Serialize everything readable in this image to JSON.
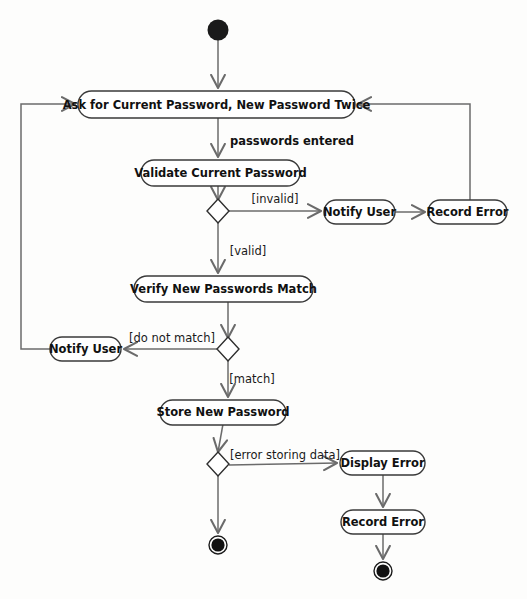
{
  "diagram": {
    "type": "uml-activity-diagram",
    "background_color": "#fdfdfc",
    "line_color": "#6b6b6b",
    "shape_stroke_color": "#3a3a3a",
    "text_color": "#111111",
    "nodes": [
      {
        "id": "start",
        "kind": "initial-node",
        "label": "",
        "x": 218,
        "y": 30,
        "r": 10
      },
      {
        "id": "ask",
        "kind": "action",
        "label": "Ask for Current Password, New Password Twice",
        "x": 78,
        "y": 91,
        "w": 277,
        "h": 26
      },
      {
        "id": "validate",
        "kind": "action",
        "label": "Validate Current Password",
        "x": 141,
        "y": 160,
        "w": 159,
        "h": 26
      },
      {
        "id": "dec1",
        "kind": "decision",
        "label": "",
        "cx": 218,
        "cy": 210,
        "rx": 11,
        "ry": 11
      },
      {
        "id": "notify1",
        "kind": "action",
        "label": "Notify User",
        "x": 324,
        "y": 200,
        "w": 71,
        "h": 24
      },
      {
        "id": "record1",
        "kind": "action",
        "label": "Record Error",
        "x": 428,
        "y": 200,
        "w": 79,
        "h": 24
      },
      {
        "id": "verify",
        "kind": "action",
        "label": "Verify New Passwords Match",
        "x": 134,
        "y": 276,
        "w": 179,
        "h": 26
      },
      {
        "id": "dec2",
        "kind": "decision",
        "label": "",
        "cx": 228,
        "cy": 348,
        "rx": 11,
        "ry": 11
      },
      {
        "id": "notify2",
        "kind": "action",
        "label": "Notify User",
        "x": 50,
        "y": 337,
        "w": 71,
        "h": 24
      },
      {
        "id": "store",
        "kind": "action",
        "label": "Store New Password",
        "x": 160,
        "y": 400,
        "w": 126,
        "h": 24
      },
      {
        "id": "dec3",
        "kind": "decision",
        "label": "",
        "cx": 218,
        "cy": 462,
        "rx": 11,
        "ry": 11
      },
      {
        "id": "display",
        "kind": "action",
        "label": "Display Error",
        "x": 340,
        "y": 451,
        "w": 85,
        "h": 24
      },
      {
        "id": "record2",
        "kind": "action",
        "label": "Record Error",
        "x": 341,
        "y": 510,
        "w": 84,
        "h": 24
      },
      {
        "id": "final1",
        "kind": "final-node",
        "label": "",
        "x": 218,
        "y": 545,
        "r": 9
      },
      {
        "id": "final2",
        "kind": "final-node",
        "label": "",
        "x": 383,
        "y": 571,
        "r": 9
      }
    ],
    "edges": [
      {
        "id": "e-start-ask",
        "from": "start",
        "to": "ask",
        "label": ""
      },
      {
        "id": "e-ask-validate",
        "from": "ask",
        "to": "validate",
        "label": "passwords entered",
        "label_x": 292,
        "label_y": 140,
        "bold": true
      },
      {
        "id": "e-validate-dec1",
        "from": "validate",
        "to": "dec1",
        "label": ""
      },
      {
        "id": "e-dec1-notify1",
        "from": "dec1",
        "to": "notify1",
        "label": "[invalid]",
        "label_x": 275,
        "label_y": 199,
        "bold": false
      },
      {
        "id": "e-notify1-record1",
        "from": "notify1",
        "to": "record1",
        "label": ""
      },
      {
        "id": "e-record1-ask",
        "from": "record1",
        "to": "ask",
        "label": ""
      },
      {
        "id": "e-dec1-verify",
        "from": "dec1",
        "to": "verify",
        "label": "[valid]",
        "label_x": 248,
        "label_y": 251,
        "bold": false
      },
      {
        "id": "e-verify-dec2",
        "from": "verify",
        "to": "dec2",
        "label": ""
      },
      {
        "id": "e-dec2-notify2",
        "from": "dec2",
        "to": "notify2",
        "label": "[do not match]",
        "label_x": 172,
        "label_y": 338,
        "bold": false
      },
      {
        "id": "e-notify2-ask",
        "from": "notify2",
        "to": "ask",
        "label": ""
      },
      {
        "id": "e-dec2-store",
        "from": "dec2",
        "to": "store",
        "label": "[match]",
        "label_x": 252,
        "label_y": 378,
        "bold": false
      },
      {
        "id": "e-store-dec3",
        "from": "store",
        "to": "dec3",
        "label": ""
      },
      {
        "id": "e-dec3-display",
        "from": "dec3",
        "to": "display",
        "label": "[error storing data]",
        "label_x": 285,
        "label_y": 454,
        "bold": false
      },
      {
        "id": "e-display-record2",
        "from": "display",
        "to": "record2",
        "label": ""
      },
      {
        "id": "e-record2-final2",
        "from": "record2",
        "to": "final2",
        "label": ""
      },
      {
        "id": "e-dec3-final1",
        "from": "dec3",
        "to": "final1",
        "label": ""
      }
    ],
    "labels": {
      "passwords_entered": "passwords entered",
      "invalid": "[invalid]",
      "valid": "[valid]",
      "do_not_match": "[do not match]",
      "match": "[match]",
      "error_storing_data": "[error storing data]"
    },
    "actions": {
      "ask": "Ask for Current Password, New Password Twice",
      "validate": "Validate Current Password",
      "notify_user_1": "Notify User",
      "record_error_1": "Record Error",
      "verify": "Verify New Passwords Match",
      "notify_user_2": "Notify User",
      "store": "Store New Password",
      "display_error": "Display Error",
      "record_error_2": "Record Error"
    }
  }
}
